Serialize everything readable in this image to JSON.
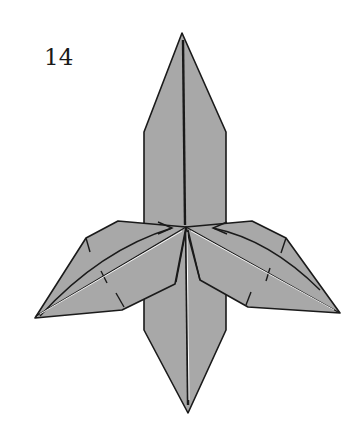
{
  "diagram": {
    "step_number": "14",
    "fill_color": "#a8a8a8",
    "line_color": "#1a1a1a",
    "highlight_color": "#ffffff"
  }
}
